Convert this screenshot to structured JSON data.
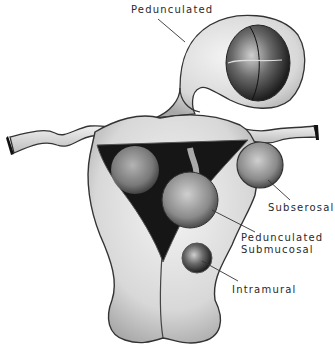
{
  "diagram": {
    "labels": {
      "pedunculated": "Pedunculated",
      "subserosal": "Subserosal",
      "pedunculated_submucosal_line1": "Pedunculated",
      "pedunculated_submucosal_line2": "Submucosal",
      "intramural": "Intramural"
    },
    "colors": {
      "background": "#ffffff",
      "tissue_light": "#e6e6e6",
      "tissue_mid": "#b8b8b8",
      "cavity_dark": "#1a1a1a",
      "outline": "#333333",
      "label_text": "#2a2a2a"
    }
  }
}
